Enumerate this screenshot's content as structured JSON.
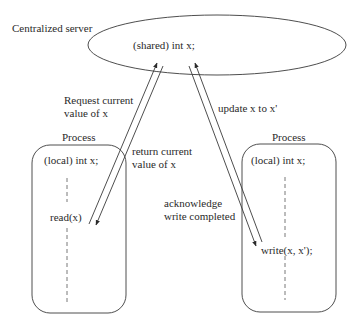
{
  "diagram": {
    "server": {
      "label": "Centralized server",
      "variable": "(shared) int x;"
    },
    "left_process": {
      "title": "Process",
      "variable": "(local) int x;",
      "operation": "read(x)"
    },
    "right_process": {
      "title": "Process",
      "variable": "(local) int x;",
      "operation": "write(x, x');"
    },
    "messages": {
      "request_line1": "Request current",
      "request_line2": "value of x",
      "return_line1": "return current",
      "return_line2": "value of x",
      "update": "update x to x'",
      "ack_line1": "acknowledge",
      "ack_line2": "write completed"
    },
    "colors": {
      "stroke": "#3a3a3a",
      "text": "#2a2a2a",
      "background": "#ffffff"
    }
  }
}
